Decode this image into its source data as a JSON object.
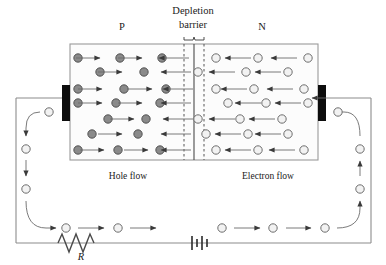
{
  "diagram": {
    "title_labels": {
      "depletion_line1": "Depletion",
      "depletion_line2": "barrier",
      "p_region": "P",
      "n_region": "N",
      "hole_flow": "Hole flow",
      "electron_flow": "Electron flow",
      "resistor": "R"
    },
    "colors": {
      "hole_fill": "#8a8a8a",
      "hole_stroke": "#4a4a4a",
      "electron_fill": "#f2f2f2",
      "electron_stroke": "#6e6e6e",
      "electrode": "#0d0d0d",
      "wire": "#8c8c8c",
      "arrow": "#3a3a3a",
      "box_stroke": "#9a9a9a",
      "box_fill": "#fcfcfc",
      "text": "#1a1a1a",
      "background": "#ffffff"
    },
    "geometry": {
      "box": {
        "x": 70,
        "y": 44,
        "width": 248,
        "height": 116
      },
      "junction_x": 194,
      "depletion_left_x": 184,
      "depletion_right_x": 204,
      "electrode_left": {
        "x": 62,
        "y": 85,
        "width": 8,
        "height": 36
      },
      "electrode_right": {
        "x": 318,
        "y": 85,
        "width": 8,
        "height": 36
      },
      "wire_bottom_y": 243,
      "wire_left_x": 16,
      "wire_right_x": 371,
      "resistor_x": 58,
      "battery_x": 192
    },
    "p_region_rows": [
      {
        "y": 58,
        "holes": [
          78,
          120,
          162
        ],
        "arrows": [
          {
            "x": 88,
            "dir": 1
          },
          {
            "x": 130,
            "dir": 1
          },
          {
            "x": 174,
            "dir": -1
          }
        ]
      },
      {
        "y": 72,
        "holes": [
          100,
          144
        ],
        "arrows": [
          {
            "x": 110,
            "dir": 1
          },
          {
            "x": 176,
            "dir": -1
          }
        ]
      },
      {
        "y": 89,
        "holes": [
          78,
          124,
          166
        ],
        "arrows": [
          {
            "x": 90,
            "dir": 1
          },
          {
            "x": 140,
            "dir": 1
          },
          {
            "x": 178,
            "dir": -1
          }
        ]
      },
      {
        "y": 103,
        "holes": [
          78,
          116,
          160
        ],
        "arrows": [
          {
            "x": 90,
            "dir": 1
          },
          {
            "x": 130,
            "dir": 1
          },
          {
            "x": 176,
            "dir": -1
          }
        ]
      },
      {
        "y": 119,
        "holes": [
          108,
          146
        ],
        "arrows": [
          {
            "x": 122,
            "dir": 1
          },
          {
            "x": 178,
            "dir": -1
          }
        ]
      },
      {
        "y": 134,
        "holes": [
          92,
          138
        ],
        "arrows": [
          {
            "x": 110,
            "dir": 1
          },
          {
            "x": 176,
            "dir": -1
          }
        ]
      },
      {
        "y": 150,
        "holes": [
          78,
          118,
          160
        ],
        "arrows": [
          {
            "x": 92,
            "dir": 1
          },
          {
            "x": 136,
            "dir": 1
          },
          {
            "x": 176,
            "dir": -1
          }
        ]
      }
    ],
    "depletion_electrons": [
      {
        "x": 198,
        "y": 72
      },
      {
        "x": 198,
        "y": 119
      },
      {
        "x": 206,
        "y": 134
      }
    ],
    "n_region_rows": [
      {
        "y": 58,
        "electrons": [
          216,
          258,
          308
        ],
        "arrows": [
          {
            "x": 238,
            "dir": -1
          },
          {
            "x": 284,
            "dir": -1
          }
        ]
      },
      {
        "y": 72,
        "electrons": [
          246,
          288
        ],
        "arrows": [
          {
            "x": 222,
            "dir": -1
          },
          {
            "x": 268,
            "dir": -1
          }
        ]
      },
      {
        "y": 89,
        "electrons": [
          216,
          254,
          304
        ],
        "arrows": [
          {
            "x": 234,
            "dir": -1
          },
          {
            "x": 280,
            "dir": -1
          }
        ]
      },
      {
        "y": 103,
        "electrons": [
          228,
          266,
          308
        ],
        "arrows": [
          {
            "x": 248,
            "dir": -1
          },
          {
            "x": 288,
            "dir": -1
          }
        ]
      },
      {
        "y": 119,
        "electrons": [
          240,
          282
        ],
        "arrows": [
          {
            "x": 222,
            "dir": -1
          },
          {
            "x": 262,
            "dir": -1
          }
        ]
      },
      {
        "y": 134,
        "electrons": [
          248,
          288
        ],
        "arrows": [
          {
            "x": 228,
            "dir": -1
          },
          {
            "x": 268,
            "dir": -1
          }
        ]
      },
      {
        "y": 150,
        "electrons": [
          216,
          258,
          304
        ],
        "arrows": [
          {
            "x": 238,
            "dir": -1
          },
          {
            "x": 282,
            "dir": -1
          }
        ]
      }
    ],
    "circuit_electrons": [
      {
        "x": 49,
        "y": 112
      },
      {
        "x": 26,
        "y": 149
      },
      {
        "x": 26,
        "y": 189
      },
      {
        "x": 66,
        "y": 228
      },
      {
        "x": 118,
        "y": 228
      },
      {
        "x": 222,
        "y": 228
      },
      {
        "x": 273,
        "y": 228
      },
      {
        "x": 325,
        "y": 228
      },
      {
        "x": 360,
        "y": 189
      },
      {
        "x": 360,
        "y": 149
      },
      {
        "x": 338,
        "y": 112
      }
    ]
  }
}
